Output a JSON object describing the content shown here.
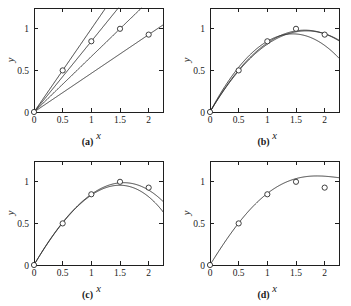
{
  "figure": {
    "background": "#ffffff",
    "ink_color": "#2a2a2a",
    "panel_count": 4
  },
  "axes": {
    "xlabel": "x",
    "ylabel": "y",
    "xticks": [
      "0",
      "0.5",
      "1",
      "1.5",
      "2"
    ],
    "xtick_values": [
      0,
      0.5,
      1,
      1.5,
      2
    ],
    "yticks": [
      "0",
      "0.5",
      "1"
    ],
    "ytick_values": [
      0,
      0.5,
      1
    ],
    "xlim": [
      0,
      2.25
    ],
    "ylim": [
      0,
      1.25
    ],
    "grid": false,
    "legend": "none"
  },
  "captions": {
    "a": "(a)",
    "b": "(b)",
    "c": "(c)",
    "d": "(d)"
  },
  "chart_data": [
    {
      "type": "line",
      "title": "(a)",
      "xlabel": "x",
      "ylabel": "y",
      "xlim": [
        0,
        2.25
      ],
      "ylim": [
        0,
        1.25
      ],
      "grid": false,
      "legend": "none",
      "points": {
        "name": "data points",
        "x": [
          0,
          0.5,
          1,
          1.5,
          2
        ],
        "y": [
          0,
          0.5,
          0.85,
          1.0,
          0.93
        ]
      },
      "series": [
        {
          "name": "linear fit through (0,0) and (0.5,0.5)",
          "slope": 1.0,
          "intercept": 0
        },
        {
          "name": "linear fit through (0,0) and (1,0.85)",
          "slope": 0.85,
          "intercept": 0
        },
        {
          "name": "linear fit through (0,0) and (1.5,1.0)",
          "slope": 0.667,
          "intercept": 0
        },
        {
          "name": "linear fit through (0,0) and (2,0.93)",
          "slope": 0.465,
          "intercept": 0
        }
      ]
    },
    {
      "type": "line",
      "title": "(b)",
      "xlabel": "x",
      "ylabel": "y",
      "xlim": [
        0,
        2.25
      ],
      "ylim": [
        0,
        1.25
      ],
      "grid": false,
      "legend": "none",
      "points": {
        "name": "data points",
        "x": [
          0,
          0.5,
          1,
          1.5,
          2
        ],
        "y": [
          0,
          0.5,
          0.85,
          1.0,
          0.93
        ]
      },
      "series": [
        {
          "name": "quadratic through first 3 points",
          "coeffs": [
            0,
            1.3,
            -0.45
          ]
        },
        {
          "name": "quadratic through first 4 points",
          "coeffs": [
            0,
            1.19,
            -0.36
          ]
        },
        {
          "name": "quadratic through all 5 points",
          "coeffs": [
            0,
            1.16,
            -0.345
          ]
        }
      ]
    },
    {
      "type": "line",
      "title": "(c)",
      "xlabel": "x",
      "ylabel": "y",
      "xlim": [
        0,
        2.25
      ],
      "ylim": [
        0,
        1.25
      ],
      "grid": false,
      "legend": "none",
      "points": {
        "name": "data points",
        "x": [
          0,
          0.5,
          1,
          1.5,
          2
        ],
        "y": [
          0,
          0.5,
          0.85,
          1.0,
          0.93
        ]
      },
      "series": [
        {
          "name": "cubic through first 4 points",
          "coeffs": [
            0,
            1.1833,
            -0.3,
            -0.0333
          ]
        },
        {
          "name": "cubic through all 5 points",
          "coeffs": [
            0,
            1.1567,
            -0.26,
            -0.0567
          ]
        }
      ]
    },
    {
      "type": "line",
      "title": "(d)",
      "xlabel": "x",
      "ylabel": "y",
      "xlim": [
        0,
        2.25
      ],
      "ylim": [
        0,
        1.25
      ],
      "grid": false,
      "legend": "none",
      "points": {
        "name": "data points",
        "x": [
          0,
          0.5,
          1,
          1.5,
          2
        ],
        "y": [
          0,
          0.5,
          0.85,
          1.0,
          0.93
        ]
      },
      "series": [
        {
          "name": "quartic interpolant through all 5 points",
          "coeffs": [
            0,
            1.1133,
            -0.1433,
            -0.1467,
            0.0367
          ]
        }
      ]
    }
  ]
}
